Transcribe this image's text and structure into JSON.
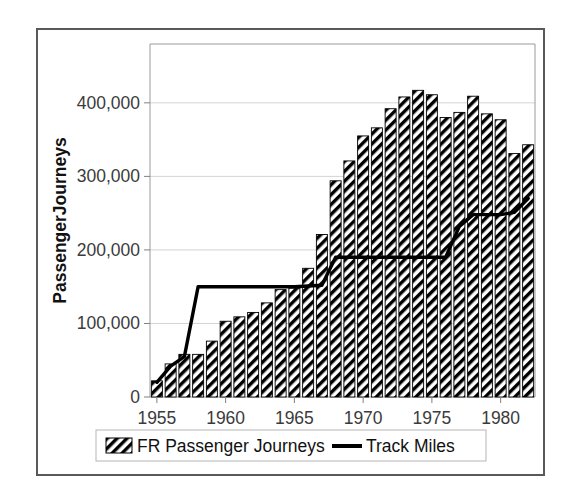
{
  "chart_data": {
    "type": "bar",
    "title": "",
    "subtitle": "",
    "xlabel": "",
    "ylabel": "PassengerJourneys",
    "ylim": [
      0,
      480000
    ],
    "xlim": [
      1954.5,
      1982.5
    ],
    "grid": true,
    "legend_position": "bottom",
    "y_ticks": [
      0,
      100000,
      200000,
      300000,
      400000
    ],
    "y_tick_labels": [
      "0",
      "100,000",
      "200,000",
      "300,000",
      "400,000"
    ],
    "x_ticks": [
      1955,
      1960,
      1965,
      1970,
      1975,
      1980
    ],
    "x_tick_labels": [
      "1955",
      "1960",
      "1965",
      "1970",
      "1975",
      "1980"
    ],
    "categories": [
      1955,
      1956,
      1957,
      1958,
      1959,
      1960,
      1961,
      1962,
      1963,
      1964,
      1965,
      1966,
      1967,
      1968,
      1969,
      1970,
      1971,
      1972,
      1973,
      1974,
      1975,
      1976,
      1977,
      1978,
      1979,
      1980,
      1981,
      1982
    ],
    "series": [
      {
        "name": "FR Passenger Journeys",
        "type": "bar",
        "fill": "diagonal-hatch",
        "color": "#000000",
        "values": [
          22000,
          45000,
          58000,
          58000,
          76000,
          103000,
          109000,
          115000,
          128000,
          146000,
          148000,
          175000,
          221000,
          294000,
          321000,
          355000,
          366000,
          392000,
          408000,
          417000,
          411000,
          380000,
          387000,
          409000,
          385000,
          377000,
          331000,
          343000
        ]
      },
      {
        "name": "Track Miles",
        "type": "line",
        "color": "#000000",
        "values": [
          20000,
          42000,
          55000,
          150000,
          150000,
          150000,
          150000,
          150000,
          150000,
          150000,
          150000,
          151000,
          152000,
          190000,
          190000,
          190000,
          190000,
          190000,
          190000,
          190000,
          190000,
          190000,
          232000,
          248000,
          248000,
          248000,
          251000,
          270000
        ]
      }
    ]
  },
  "legend": {
    "items": [
      {
        "label": "FR Passenger Journeys",
        "marker": "hatch-swatch"
      },
      {
        "label": "Track Miles",
        "marker": "line-swatch"
      }
    ]
  },
  "axis": {
    "y_title": "PassengerJourneys"
  },
  "colors": {
    "frame": "#59595b",
    "plot_border": "#9a9a9a",
    "gridline": "#d4d4d4",
    "ink": "#000000",
    "background": "#ffffff"
  }
}
